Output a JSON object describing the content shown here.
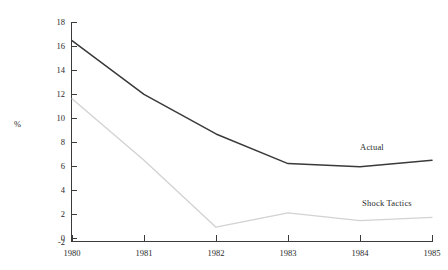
{
  "chart_data": {
    "type": "line",
    "title": "",
    "xlabel": "",
    "ylabel": "%",
    "x": [
      1980,
      1981,
      1982,
      1983,
      1984,
      1985
    ],
    "xticklabels": [
      "1980",
      "1981",
      "1982",
      "1983",
      "1984",
      "1985"
    ],
    "xlim": [
      1980,
      1985
    ],
    "ylim": [
      -2,
      18
    ],
    "yticks": [
      -2,
      0,
      2,
      4,
      6,
      8,
      10,
      12,
      14,
      16,
      18
    ],
    "yticklabels": [
      "-2",
      "0",
      "2",
      "4",
      "6",
      "8",
      "10",
      "12",
      "14",
      "16",
      "18"
    ],
    "grid": false,
    "legend": "inline-labels",
    "series": [
      {
        "name": "Actual",
        "color": "#3a3a3a",
        "values": [
          16.3,
          11.4,
          7.8,
          5.1,
          4.8,
          5.4
        ],
        "label_text": "Actual"
      },
      {
        "name": "Shock Tactics",
        "color": "#d2d2d2",
        "values": [
          11.0,
          5.4,
          -0.7,
          0.6,
          -0.1,
          0.2
        ],
        "label_text": "Shock  Tactics"
      }
    ]
  },
  "labels": {
    "y_axis_title": "%",
    "actual_series": "Actual",
    "shock_series": "Shock  Tactics",
    "y_18": "18",
    "y_16": "16",
    "y_14": "14",
    "y_12": "12",
    "y_10": "10",
    "y_8": "8",
    "y_6": "6",
    "y_4": "4",
    "y_2": "2",
    "y_0": "0",
    "y_m2": "-2",
    "x_1980": "1980",
    "x_1981": "1981",
    "x_1982": "1982",
    "x_1983": "1983",
    "x_1984": "1984",
    "x_1985": "1985"
  }
}
